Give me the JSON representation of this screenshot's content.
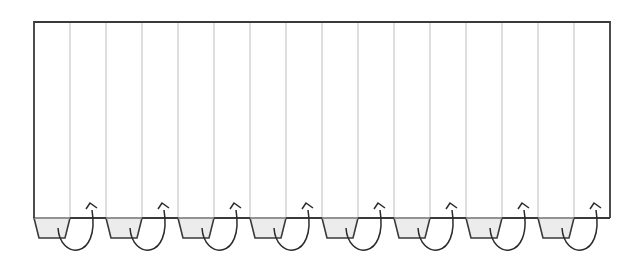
{
  "diagram": {
    "colors": {
      "outline": "#3a3a3a",
      "fold_line": "#bdbdbd",
      "tab_fill": "#ececec",
      "arrow": "#2a2a2a",
      "background": "#ffffff"
    },
    "rect": {
      "left": 34,
      "top": 22,
      "right": 610,
      "bottom": 218
    },
    "panels": 16,
    "panel_width": 36,
    "tabs": [
      {
        "index": 0,
        "column": 0
      },
      {
        "index": 1,
        "column": 2
      },
      {
        "index": 2,
        "column": 4
      },
      {
        "index": 3,
        "column": 6
      },
      {
        "index": 4,
        "column": 8
      },
      {
        "index": 5,
        "column": 10
      },
      {
        "index": 6,
        "column": 12
      },
      {
        "index": 7,
        "column": 14
      }
    ],
    "tab_height": 20,
    "tab_inset": 5,
    "arrow_label": "fold up behind"
  }
}
